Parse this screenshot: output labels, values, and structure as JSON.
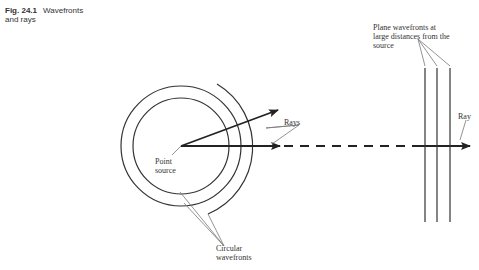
{
  "figure": {
    "number": "Fig. 24.1",
    "title_line1": "Wavefronts",
    "title_line2": "and rays"
  },
  "labels": {
    "plane_wavefronts_1": "Plane wavefronts at",
    "plane_wavefronts_2": "large distances from the",
    "plane_wavefronts_3": "source",
    "rays": "Rays",
    "ray": "Ray",
    "point_source_1": "Point",
    "point_source_2": "source",
    "circular_wavefronts_1": "Circular",
    "circular_wavefronts_2": "wavefronts"
  },
  "colors": {
    "line": "#333333",
    "leader": "#777777"
  }
}
